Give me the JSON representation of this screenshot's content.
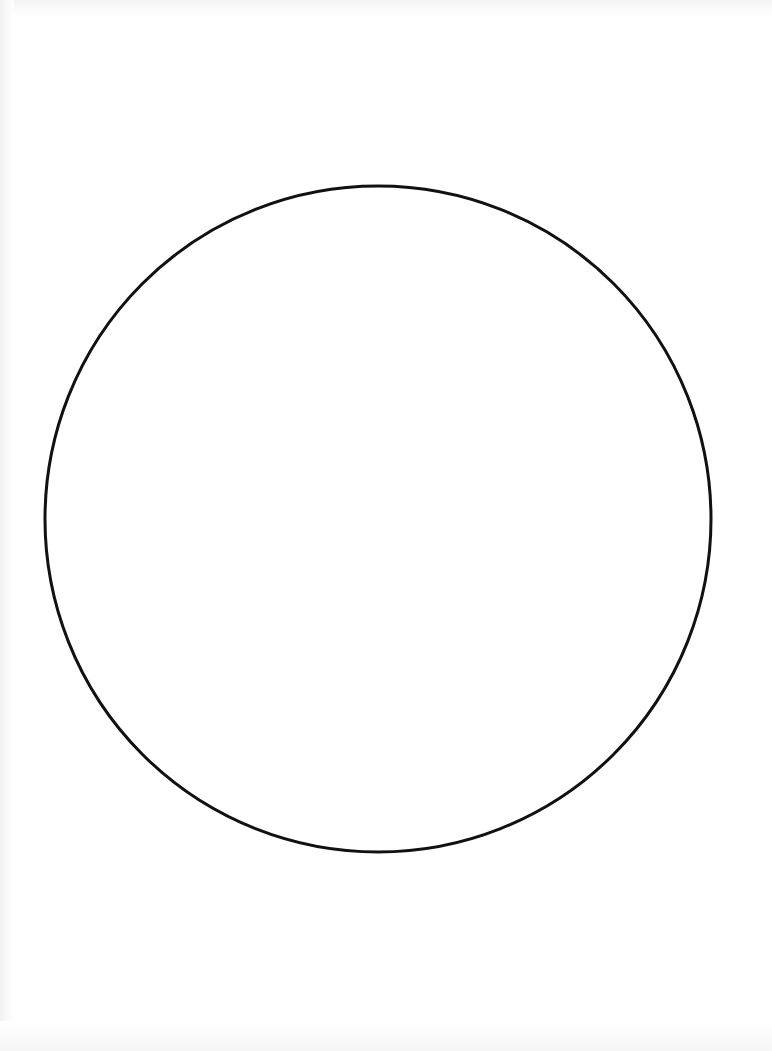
{
  "canvas": {
    "width": 772,
    "height": 1051,
    "background": "#ffffff"
  },
  "diagram": {
    "shapes": [
      {
        "type": "circle",
        "cx": 378,
        "cy": 519,
        "r": 333,
        "stroke": "#111111",
        "stroke_width": 3,
        "fill": "none"
      }
    ]
  }
}
